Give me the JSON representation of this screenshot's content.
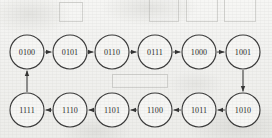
{
  "diagram": {
    "type": "state-transition-cycle",
    "canvas": {
      "width": 272,
      "height": 138
    },
    "node_radius": 17,
    "rows": {
      "top_y": 52,
      "bottom_y": 110
    },
    "nodes": [
      {
        "id": "n1",
        "label": "0100",
        "cx": 27,
        "cy": 52,
        "row": "top"
      },
      {
        "id": "n2",
        "label": "0101",
        "cx": 70,
        "cy": 52,
        "row": "top"
      },
      {
        "id": "n3",
        "label": "0110",
        "cx": 112,
        "cy": 52,
        "row": "top"
      },
      {
        "id": "n4",
        "label": "0111",
        "cx": 155,
        "cy": 52,
        "row": "top"
      },
      {
        "id": "n5",
        "label": "1000",
        "cx": 199,
        "cy": 52,
        "row": "top"
      },
      {
        "id": "n6",
        "label": "1001",
        "cx": 243,
        "cy": 52,
        "row": "top"
      },
      {
        "id": "n7",
        "label": "1010",
        "cx": 243,
        "cy": 110,
        "row": "bottom"
      },
      {
        "id": "n8",
        "label": "1011",
        "cx": 199,
        "cy": 110,
        "row": "bottom"
      },
      {
        "id": "n9",
        "label": "1100",
        "cx": 155,
        "cy": 110,
        "row": "bottom"
      },
      {
        "id": "n10",
        "label": "1101",
        "cx": 112,
        "cy": 110,
        "row": "bottom"
      },
      {
        "id": "n11",
        "label": "1110",
        "cx": 70,
        "cy": 110,
        "row": "bottom"
      },
      {
        "id": "n12",
        "label": "1111",
        "cx": 27,
        "cy": 110,
        "row": "bottom"
      }
    ],
    "edges": [
      {
        "from": "0100",
        "to": "0101",
        "direction": "right"
      },
      {
        "from": "0101",
        "to": "0110",
        "direction": "right"
      },
      {
        "from": "0110",
        "to": "0111",
        "direction": "right"
      },
      {
        "from": "0111",
        "to": "1000",
        "direction": "right"
      },
      {
        "from": "1000",
        "to": "1001",
        "direction": "right"
      },
      {
        "from": "1001",
        "to": "1010",
        "direction": "down"
      },
      {
        "from": "1010",
        "to": "1011",
        "direction": "left"
      },
      {
        "from": "1011",
        "to": "1100",
        "direction": "left"
      },
      {
        "from": "1100",
        "to": "1101",
        "direction": "left"
      },
      {
        "from": "1101",
        "to": "1110",
        "direction": "left"
      },
      {
        "from": "1110",
        "to": "1111",
        "direction": "left"
      },
      {
        "from": "1111",
        "to": "0100",
        "direction": "up"
      }
    ],
    "colors": {
      "ink": "#2a2a2a",
      "stroke": "#3a3a3a",
      "paper": "#f3f3f1"
    },
    "bleed_marks": [
      {
        "x": 149,
        "y": -6,
        "w": 28,
        "h": 26
      },
      {
        "x": 186,
        "y": -8,
        "w": 30,
        "h": 28
      },
      {
        "x": 224,
        "y": -4,
        "w": 30,
        "h": 24
      },
      {
        "x": 59,
        "y": 2,
        "w": 22,
        "h": 18
      },
      {
        "x": 112,
        "y": 74,
        "w": 54,
        "h": 12
      }
    ]
  }
}
